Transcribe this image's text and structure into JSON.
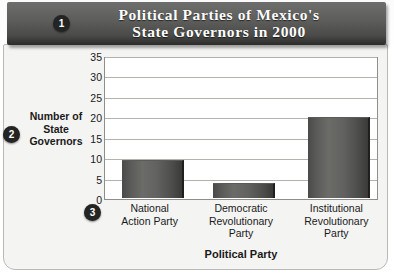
{
  "banner": {
    "title_line1": "Political Parties of Mexico's",
    "title_line2": "State Governors in 2000"
  },
  "markers": {
    "one": "1",
    "two": "2",
    "three": "3"
  },
  "axis_titles": {
    "y_line1": "Number of",
    "y_line2": "State",
    "y_line3": "Governors",
    "x": "Political Party"
  },
  "chart_data": {
    "type": "bar",
    "title": "Political Parties of Mexico's State Governors in 2000",
    "xlabel": "Political Party",
    "ylabel": "Number of State Governors",
    "categories": [
      "National Action Party",
      "Democratic Revolutionary Party",
      "Institutional Revolutionary Party"
    ],
    "category_lines": [
      [
        "National",
        "Action Party"
      ],
      [
        "Democratic",
        "Revolutionary",
        "Party"
      ],
      [
        "Institutional",
        "Revolutionary",
        "Party"
      ]
    ],
    "values": [
      9,
      3.5,
      19.5
    ],
    "ylim": [
      0,
      35
    ],
    "ytick_labels": [
      "0",
      "5",
      "10",
      "15",
      "20",
      "25",
      "30",
      "35"
    ],
    "ytick_values": [
      0,
      5,
      10,
      15,
      20,
      25,
      30,
      35
    ],
    "grid": true,
    "legend": "none",
    "bar_color": "#5a5a58"
  },
  "colors": {
    "banner": "#4a4a48",
    "page": "#f4f4f2",
    "plot_bg": "#ffffff",
    "grid": "#b2b2ae",
    "text": "#1a1a1a",
    "marker": "#242424"
  }
}
